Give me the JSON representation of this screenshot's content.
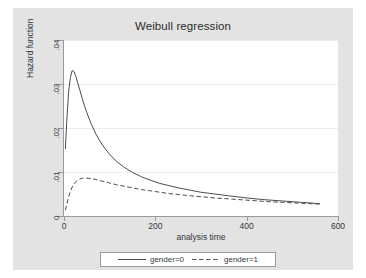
{
  "figure": {
    "background": "#e3e3e3",
    "plot_background": "#ffffff",
    "axis_color": "#9a9a9a",
    "grid_color": "#ececed",
    "line_color": "#4d4d4d"
  },
  "chart_data": {
    "type": "line",
    "title": "Weibull regression",
    "xlabel": "analysis time",
    "ylabel": "Hazard function",
    "xlim": [
      0,
      600
    ],
    "ylim": [
      0,
      0.04
    ],
    "xticks": [
      0,
      200,
      400,
      600
    ],
    "xtick_labels": [
      "0",
      "200",
      "400",
      "600"
    ],
    "yticks": [
      0,
      0.01,
      0.02,
      0.03,
      0.04
    ],
    "ytick_labels": [
      "0",
      ".01",
      ".02",
      ".03",
      ".04"
    ],
    "grid": "horizontal",
    "legend_position": "bottom",
    "series": [
      {
        "name": "gender=0",
        "style": "solid",
        "x": [
          3,
          6,
          10,
          14,
          18,
          22,
          26,
          30,
          35,
          40,
          45,
          50,
          60,
          70,
          80,
          90,
          100,
          115,
          130,
          150,
          170,
          190,
          210,
          230,
          250,
          275,
          300,
          330,
          360,
          400,
          440,
          480,
          520,
          560
        ],
        "y": [
          0.0152,
          0.0215,
          0.0281,
          0.0315,
          0.0331,
          0.0328,
          0.0317,
          0.0303,
          0.0285,
          0.0267,
          0.025,
          0.0235,
          0.0208,
          0.0186,
          0.0168,
          0.0153,
          0.014,
          0.0124,
          0.0112,
          0.0099,
          0.0089,
          0.0081,
          0.0074,
          0.0069,
          0.0064,
          0.0059,
          0.0054,
          0.005,
          0.0046,
          0.0041,
          0.0037,
          0.0034,
          0.0031,
          0.0028
        ]
      },
      {
        "name": "gender=1",
        "style": "dashed",
        "x": [
          3,
          6,
          10,
          14,
          18,
          22,
          26,
          30,
          35,
          40,
          45,
          50,
          60,
          70,
          80,
          90,
          100,
          115,
          130,
          150,
          170,
          190,
          210,
          230,
          250,
          275,
          300,
          330,
          360,
          400,
          440,
          480,
          520,
          560
        ],
        "y": [
          0.0013,
          0.0026,
          0.0043,
          0.0056,
          0.0066,
          0.0073,
          0.0078,
          0.0081,
          0.0084,
          0.0086,
          0.0086,
          0.0086,
          0.0085,
          0.0083,
          0.008,
          0.0078,
          0.0075,
          0.0071,
          0.0068,
          0.0064,
          0.006,
          0.0057,
          0.0054,
          0.0051,
          0.0049,
          0.0046,
          0.0044,
          0.0041,
          0.0039,
          0.0036,
          0.0033,
          0.0031,
          0.0029,
          0.0027
        ]
      }
    ]
  },
  "legend": {
    "entries": [
      {
        "label": "gender=0",
        "style": "solid"
      },
      {
        "label": "gender=1",
        "style": "dashed"
      }
    ]
  }
}
